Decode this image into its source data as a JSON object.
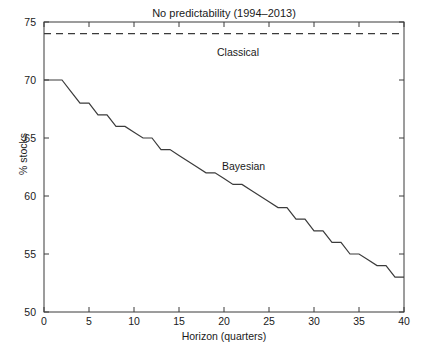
{
  "chart_data": {
    "type": "line",
    "title": "No predictability (1994–2013)",
    "xlabel": "Horizon (quarters)",
    "ylabel": "% stocks",
    "xlim": [
      0,
      40
    ],
    "ylim": [
      50,
      75
    ],
    "xticks": [
      0,
      5,
      10,
      15,
      20,
      25,
      30,
      35,
      40
    ],
    "yticks": [
      50,
      55,
      60,
      65,
      70,
      75
    ],
    "grid": false,
    "legend_position": "inline-annotation",
    "annotations": [
      {
        "text": "Classical",
        "x": 20.0,
        "y": 72.2
      },
      {
        "text": "Bayesian",
        "x": 21.0,
        "y": 62.8
      }
    ],
    "series": [
      {
        "name": "Classical",
        "style": "dashed",
        "color": "#3b3b3b",
        "x": [
          0,
          40
        ],
        "values": [
          74.0,
          74.0
        ]
      },
      {
        "name": "Bayesian",
        "style": "solid",
        "color": "#3b3b3b",
        "x": [
          0,
          1,
          2,
          3,
          4,
          5,
          6,
          7,
          8,
          9,
          10,
          11,
          12,
          13,
          14,
          15,
          16,
          17,
          18,
          19,
          20,
          21,
          22,
          23,
          24,
          25,
          26,
          27,
          28,
          29,
          30,
          31,
          32,
          33,
          34,
          35,
          36,
          37,
          38,
          39,
          40
        ],
        "values": [
          70.0,
          70.0,
          70.0,
          69.0,
          68.0,
          68.0,
          67.0,
          67.0,
          66.0,
          66.0,
          65.5,
          65.0,
          65.0,
          64.0,
          64.0,
          63.5,
          63.0,
          62.5,
          62.0,
          62.0,
          61.5,
          61.0,
          61.0,
          60.5,
          60.0,
          59.5,
          59.0,
          59.0,
          58.0,
          58.0,
          57.0,
          57.0,
          56.0,
          56.0,
          55.0,
          55.0,
          54.5,
          54.0,
          54.0,
          53.0,
          53.0
        ]
      }
    ]
  },
  "axis": {
    "ytick_labels": [
      "75",
      "70",
      "65",
      "60",
      "55",
      "50"
    ],
    "xtick_labels": [
      "0",
      "5",
      "10",
      "15",
      "20",
      "25",
      "30",
      "35",
      "40"
    ]
  },
  "colors": {
    "axis": "#3b3b3b",
    "line": "#3b3b3b",
    "background": "#ffffff",
    "text": "#1a1a1a"
  }
}
